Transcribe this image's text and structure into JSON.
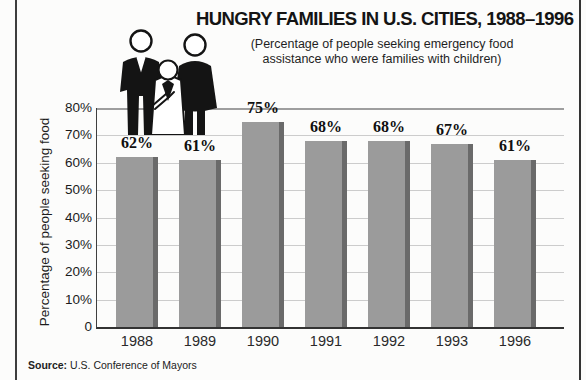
{
  "page": {
    "source_label": "Source:",
    "source_text": "U.S. Conference of Mayors",
    "background": "#fcfcfb",
    "edge_rule_color": "#3d3d3d"
  },
  "icons": {
    "family": "family-with-child-pictogram"
  },
  "chart_data": {
    "type": "bar",
    "title": "HUNGRY FAMILIES IN U.S. CITIES, 1988–1996",
    "subtitle": "(Percentage of people seeking emergency food assistance who were families with children)",
    "subtitle_lines": [
      "(Percentage of people seeking emergency food",
      "assistance who were families with children)"
    ],
    "ylabel": "Percentage of people seeking food",
    "xlabel": "",
    "categories": [
      "1988",
      "1989",
      "1990",
      "1991",
      "1992",
      "1993",
      "1996"
    ],
    "values": [
      62,
      61,
      75,
      68,
      68,
      67,
      61
    ],
    "value_labels": [
      "62%",
      "61%",
      "75%",
      "68%",
      "68%",
      "67%",
      "61%"
    ],
    "ylim": [
      0,
      80
    ],
    "ytick_step": 10,
    "ytick_labels": [
      "80%",
      "70%",
      "60%",
      "50%",
      "40%",
      "30%",
      "20%",
      "10%",
      "0"
    ],
    "grid": true,
    "legend": false,
    "bar_color": "#9b9b9b",
    "bar_shadow_color": "#6a6a6a",
    "gridline_color": "#cccccc",
    "top_gridline_color": "#9e9e9e",
    "axis_color": "#3a3a3a"
  }
}
